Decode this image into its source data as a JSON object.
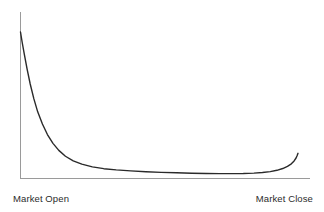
{
  "figure": {
    "background_color": "#ffffff",
    "width": 324,
    "height": 212
  },
  "axes": {
    "axis_color": "#9a9a9a",
    "axis_width": 1,
    "y_axis": {
      "x": 20.5,
      "y_top": 12,
      "y_bottom": 178
    },
    "x_axis": {
      "y": 178.5,
      "x_left": 20,
      "x_right": 310
    }
  },
  "labels": {
    "x_open": "Market Open",
    "x_close": "Market Close",
    "text_color": "#2b2b2b"
  },
  "chart_data": {
    "type": "line",
    "title": "",
    "subtitle": "",
    "xlabel": "",
    "ylabel": "",
    "series": [
      {
        "name": "Intraday Trading Volume",
        "color": "#2a2a2a",
        "line_width": 1.4,
        "x": [
          0.0,
          0.006,
          0.014,
          0.024,
          0.035,
          0.048,
          0.062,
          0.079,
          0.097,
          0.117,
          0.138,
          0.162,
          0.19,
          0.221,
          0.259,
          0.3,
          0.345,
          0.397,
          0.452,
          0.507,
          0.562,
          0.617,
          0.669,
          0.717,
          0.762,
          0.803,
          0.841,
          0.872,
          0.9,
          0.924,
          0.945,
          0.962,
          0.976,
          0.986,
          0.993,
          0.997,
          1.0
        ],
        "y": [
          1.0,
          0.93,
          0.845,
          0.745,
          0.645,
          0.545,
          0.455,
          0.372,
          0.3,
          0.24,
          0.192,
          0.152,
          0.12,
          0.098,
          0.079,
          0.067,
          0.059,
          0.052,
          0.046,
          0.042,
          0.039,
          0.036,
          0.034,
          0.033,
          0.033,
          0.034,
          0.037,
          0.041,
          0.047,
          0.056,
          0.068,
          0.083,
          0.1,
          0.12,
          0.14,
          0.157,
          0.172
        ]
      }
    ],
    "xlim": [
      0,
      1
    ],
    "ylim": [
      0,
      1
    ],
    "x_tick_labels": [
      "Market Open",
      "Market Close"
    ],
    "y_tick_labels": [],
    "grid": false,
    "legend": false,
    "legend_position": "none",
    "annotations": []
  }
}
